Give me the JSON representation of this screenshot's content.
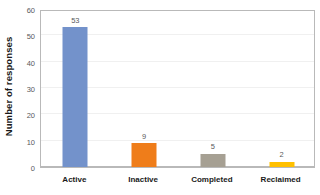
{
  "chart_data": {
    "type": "bar",
    "title": "",
    "xlabel": "",
    "ylabel": "Number of responses",
    "categories": [
      "Active",
      "Inactive",
      "Completed",
      "Reclaimed"
    ],
    "values": [
      53,
      9,
      5,
      2
    ],
    "value_labels": [
      "53",
      "9",
      "5",
      "2"
    ],
    "bar_colors": [
      "#7392cb",
      "#ef7d1a",
      "#a6a093",
      "#ffc000"
    ],
    "ylim": [
      0,
      60
    ],
    "yticks": [
      0,
      10,
      20,
      30,
      40,
      50,
      60
    ],
    "ytick_labels": [
      "0",
      "10",
      "20",
      "30",
      "40",
      "50",
      "60"
    ],
    "grid": true,
    "grid_color": "#f0f0f0",
    "legend": false,
    "legend_position": "none",
    "plot_border_color": "#b9b9b9",
    "background_color": "#ffffff",
    "tick_label_color": "#58595b",
    "axis_title_color": "#1a1a1a"
  }
}
